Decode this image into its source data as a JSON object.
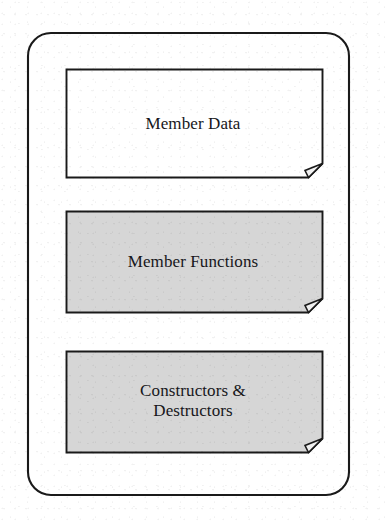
{
  "diagram": {
    "type": "class-structure-block-diagram",
    "container": {
      "name": "class-outline",
      "shape": "rounded-rectangle",
      "fill": "#ffffff",
      "stroke": "#1a1a1a"
    },
    "blocks": [
      {
        "id": "member-data",
        "label": "Member Data",
        "fill": "#ffffff",
        "stroke": "#1a1a1a",
        "shape": "document-folded-corner",
        "lines": 1
      },
      {
        "id": "member-functions",
        "label": "Member Functions",
        "fill": "#d6d6d6",
        "stroke": "#1a1a1a",
        "shape": "document-folded-corner",
        "lines": 1
      },
      {
        "id": "constructors-destructors",
        "label": "Constructors &\nDestructors",
        "fill": "#d6d6d6",
        "stroke": "#1a1a1a",
        "shape": "document-folded-corner",
        "lines": 2
      }
    ]
  }
}
